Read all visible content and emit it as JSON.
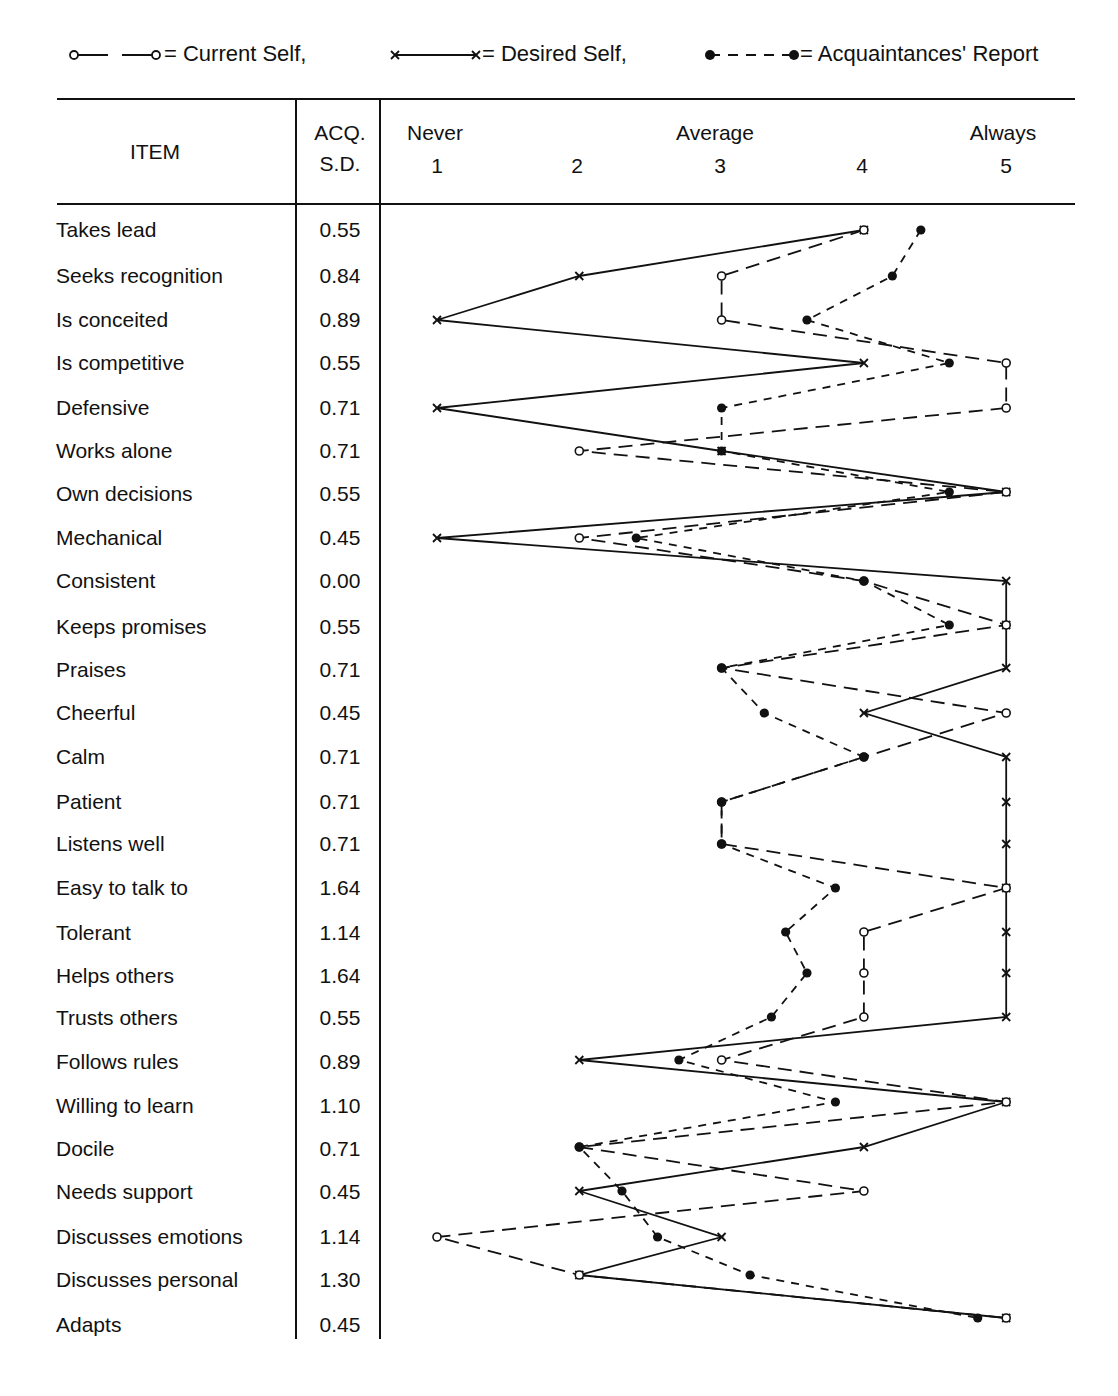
{
  "chart_data": {
    "type": "line",
    "orientation": "horizontal-profile",
    "title": "",
    "legend": [
      {
        "key": "current",
        "label": "= Current Self,",
        "marker": "open-circle",
        "line": "long-dash"
      },
      {
        "key": "desired",
        "label": "= Desired Self,",
        "marker": "x",
        "line": "solid"
      },
      {
        "key": "acq",
        "label": "= Acquaintances' Report",
        "marker": "filled-circle",
        "line": "short-dash"
      }
    ],
    "table_headers": {
      "item": "ITEM",
      "sd_line1": "ACQ.",
      "sd_line2": "S.D."
    },
    "scale": {
      "anchors": [
        {
          "label": "Never",
          "value": 1
        },
        {
          "label": "Average",
          "value": 3
        },
        {
          "label": "Always",
          "value": 5
        }
      ],
      "ticks": [
        "1",
        "2",
        "3",
        "4",
        "5"
      ],
      "range": [
        1,
        5
      ]
    },
    "categories": [
      "Takes lead",
      "Seeks recognition",
      "Is conceited",
      "Is competitive",
      "Defensive",
      "Works alone",
      "Own decisions",
      "Mechanical",
      "Consistent",
      "Keeps promises",
      "Praises",
      "Cheerful",
      "Calm",
      "Patient",
      "Listens well",
      "Easy to talk to",
      "Tolerant",
      "Helps others",
      "Trusts others",
      "Follows rules",
      "Willing to learn",
      "Docile",
      "Needs support",
      "Discusses emotions",
      "Discusses personal",
      "Adapts"
    ],
    "acq_sd": [
      "0.55",
      "0.84",
      "0.89",
      "0.55",
      "0.71",
      "0.71",
      "0.55",
      "0.45",
      "0.00",
      "0.55",
      "0.71",
      "0.45",
      "0.71",
      "0.71",
      "0.71",
      "1.64",
      "1.14",
      "1.64",
      "0.55",
      "0.89",
      "1.10",
      "0.71",
      "0.45",
      "1.14",
      "1.30",
      "0.45"
    ],
    "series": [
      {
        "name": "Current Self",
        "values": [
          4,
          3,
          3,
          5,
          5,
          2,
          5,
          2,
          4,
          5,
          3,
          5,
          4,
          3,
          3,
          5,
          4,
          4,
          4,
          3,
          5,
          2,
          4,
          1,
          2,
          5
        ]
      },
      {
        "name": "Desired Self",
        "values": [
          4,
          2,
          1,
          4,
          1,
          3,
          5,
          1,
          5,
          5,
          5,
          4,
          5,
          5,
          5,
          5,
          5,
          5,
          5,
          2,
          5,
          4,
          2,
          3,
          2,
          5
        ]
      },
      {
        "name": "Acquaintances' Report",
        "values": [
          4.4,
          4.2,
          3.6,
          4.6,
          3,
          3,
          4.6,
          2.4,
          4,
          4.6,
          3,
          3.3,
          4,
          3,
          3,
          3.8,
          3.45,
          3.6,
          3.35,
          2.7,
          3.8,
          2,
          2.3,
          2.55,
          3.2,
          4.8
        ]
      }
    ],
    "row_y": [
      230,
      276,
      320,
      363,
      408,
      451,
      492,
      538,
      581,
      625,
      668,
      713,
      757,
      802,
      844,
      888,
      932,
      973,
      1017,
      1060,
      1102,
      1147,
      1191,
      1237,
      1275,
      1318
    ],
    "xlabel": "",
    "ylabel": "ITEM",
    "grid": false
  }
}
